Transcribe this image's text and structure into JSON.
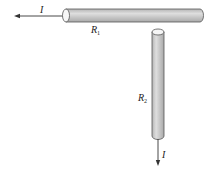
{
  "diagram": {
    "type": "two resistive rods carrying current",
    "labels": {
      "current_in": "I",
      "current_out": "I",
      "rod1": {
        "symbol": "R",
        "subscript": "1"
      },
      "rod2": {
        "symbol": "R",
        "subscript": "2"
      }
    },
    "colors": {
      "rod_fill": "#c8c8c8",
      "rod_highlight": "#e2e2e2",
      "rod_stroke": "#555555",
      "arrow": "#333333"
    }
  }
}
